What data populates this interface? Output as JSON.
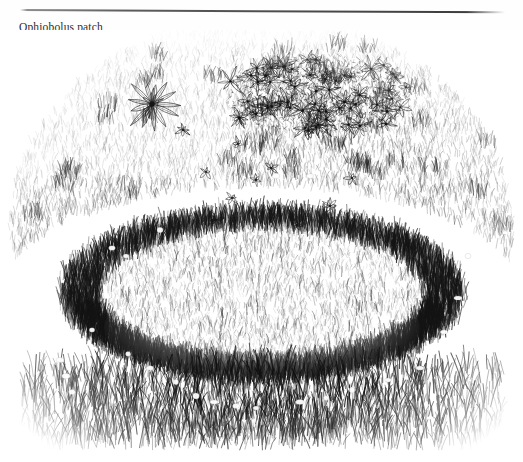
{
  "page": {
    "width": 523,
    "height": 462,
    "background_color": "#ffffff"
  },
  "rule": {
    "name": "horizontal-rule",
    "color": "#4a4a4a"
  },
  "caption": {
    "text": "Ophiobolus patch",
    "color": "#2b2b2b"
  },
  "illustration": {
    "name": "ophiobolus-patch-illustration",
    "medium": "pen-and-ink line drawing",
    "subject": "turfgrass lawn showing an Ophiobolus (take-all) patch ring",
    "ink_color": "#1c1c1c",
    "paper_color": "#ffffff",
    "features": [
      {
        "name": "ophiobolus-ring",
        "label": "Ophiobolus patch ring",
        "shape": "oval",
        "center_x": 262,
        "center_y": 300,
        "radius_x": 185,
        "radius_y": 78,
        "band_width": 26,
        "description": "dark dense grass ring with bleached pale halo just outside"
      },
      {
        "name": "ring-halo",
        "label": "bleached outer halo",
        "tone": "pale"
      },
      {
        "name": "ring-interior",
        "label": "sunken patch interior",
        "tone": "mid grey, finer grass"
      },
      {
        "name": "rosette-weed",
        "label": "rosette weed",
        "center_x": 152,
        "center_y": 104,
        "radius": 30,
        "petal_count": 13
      },
      {
        "name": "weed-mat",
        "label": "broadleaf weed mat",
        "center_x": 320,
        "center_y": 95,
        "width": 185,
        "height": 78
      },
      {
        "name": "scattered-weeds",
        "label": "scattered small weeds",
        "count": 9
      },
      {
        "name": "turf-field",
        "label": "surrounding turfgrass",
        "tone": "stippled grey"
      }
    ]
  }
}
